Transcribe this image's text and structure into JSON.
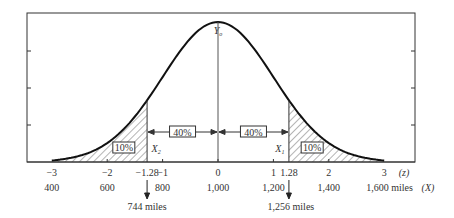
{
  "diagram": {
    "type": "normal-distribution",
    "mean_label": "Y",
    "mean_label_sub": "o",
    "z_axis": {
      "ticks": [
        {
          "z": -3,
          "label": "−3"
        },
        {
          "z": -2,
          "label": "−2"
        },
        {
          "z": -1.28,
          "label": "−1.28"
        },
        {
          "z": -1,
          "label": "−1"
        },
        {
          "z": 0,
          "label": "0"
        },
        {
          "z": 1,
          "label": "1"
        },
        {
          "z": 1.28,
          "label": "1.28"
        },
        {
          "z": 2,
          "label": "2"
        },
        {
          "z": 3,
          "label": "3"
        }
      ],
      "unit_label": "(z)"
    },
    "x_axis": {
      "ticks": [
        {
          "z": -3,
          "label": "400"
        },
        {
          "z": -2,
          "label": "600"
        },
        {
          "z": -1,
          "label": "800"
        },
        {
          "z": 0,
          "label": "1,000"
        },
        {
          "z": 1,
          "label": "1,200"
        },
        {
          "z": 2,
          "label": "1,400"
        },
        {
          "z": 3,
          "label": "1,600 miles"
        }
      ],
      "unit_label": "(X)"
    },
    "regions": {
      "left_tail_pct": "10%",
      "left_center_pct": "40%",
      "right_center_pct": "40%",
      "right_tail_pct": "10%"
    },
    "cutoffs": {
      "left": {
        "z": -1.28,
        "label": "X",
        "sub": "2",
        "value_label": "744 miles"
      },
      "right": {
        "z": 1.28,
        "label": "X",
        "sub": "1",
        "value_label": "1,256 miles"
      }
    }
  }
}
